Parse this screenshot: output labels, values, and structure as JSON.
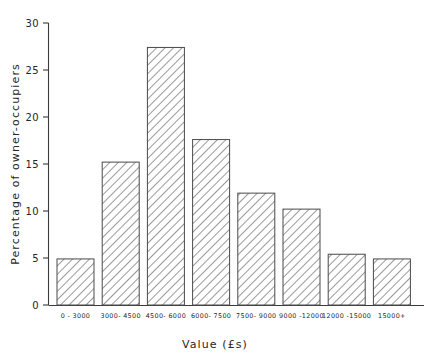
{
  "chart_data": {
    "type": "bar",
    "title": "",
    "subtitle": "",
    "xlabel": "Value (£s)",
    "ylabel": "Percentage of owner-occupiers",
    "categories": [
      "0 - 3000",
      "3000- 4500",
      "4500- 6000",
      "6000- 7500",
      "7500- 9000",
      "9000 -12000",
      "12000 -15000",
      "15000+"
    ],
    "values": [
      4.9,
      15.2,
      27.4,
      17.6,
      11.9,
      10.2,
      5.4,
      4.9
    ],
    "ylim": [
      0,
      30
    ],
    "yticks": [
      0,
      5,
      10,
      15,
      20,
      25,
      30
    ],
    "ytick_labels": [
      "0",
      "5",
      "10",
      "15",
      "20",
      "25",
      "30"
    ],
    "grid": false,
    "legend": null,
    "legend_position": "none",
    "bar_fill": "hatch-diagonal",
    "bar_edge_color": "#4a4a4a",
    "axis_color": "#3a3a3a",
    "background": "#ffffff"
  }
}
